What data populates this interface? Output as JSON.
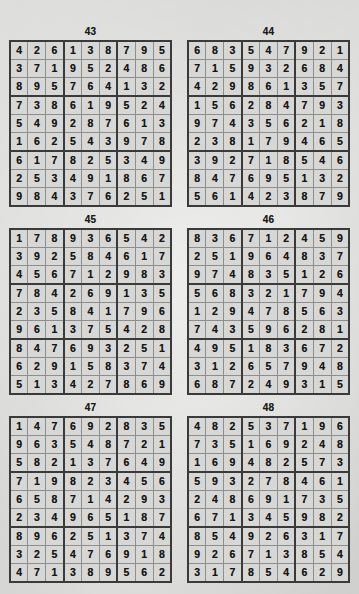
{
  "page": {
    "type": "sudoku-solutions-page",
    "background_color": "#d9d9d7",
    "ink_color": "#161616",
    "grid_line_color": "#8e8e8c",
    "box_line_color": "#3a3a3a",
    "columns": 2,
    "rows": 3
  },
  "puzzles": [
    {
      "number": "43",
      "grid": [
        [
          "4",
          "2",
          "6",
          "1",
          "3",
          "8",
          "7",
          "9",
          "5"
        ],
        [
          "3",
          "7",
          "1",
          "9",
          "5",
          "2",
          "4",
          "8",
          "6"
        ],
        [
          "8",
          "9",
          "5",
          "7",
          "6",
          "4",
          "1",
          "3",
          "2"
        ],
        [
          "7",
          "3",
          "8",
          "6",
          "1",
          "9",
          "5",
          "2",
          "4"
        ],
        [
          "5",
          "4",
          "9",
          "2",
          "8",
          "7",
          "6",
          "1",
          "3"
        ],
        [
          "1",
          "6",
          "2",
          "5",
          "4",
          "3",
          "9",
          "7",
          "8"
        ],
        [
          "6",
          "1",
          "7",
          "8",
          "2",
          "5",
          "3",
          "4",
          "9"
        ],
        [
          "2",
          "5",
          "3",
          "4",
          "9",
          "1",
          "8",
          "6",
          "7"
        ],
        [
          "9",
          "8",
          "4",
          "3",
          "7",
          "6",
          "2",
          "5",
          "1"
        ]
      ]
    },
    {
      "number": "44",
      "grid": [
        [
          "6",
          "8",
          "3",
          "5",
          "4",
          "7",
          "9",
          "2",
          "1"
        ],
        [
          "7",
          "1",
          "5",
          "9",
          "3",
          "2",
          "6",
          "8",
          "4"
        ],
        [
          "4",
          "2",
          "9",
          "8",
          "6",
          "1",
          "3",
          "5",
          "7"
        ],
        [
          "1",
          "5",
          "6",
          "2",
          "8",
          "4",
          "7",
          "9",
          "3"
        ],
        [
          "9",
          "7",
          "4",
          "3",
          "5",
          "6",
          "2",
          "1",
          "8"
        ],
        [
          "2",
          "3",
          "8",
          "1",
          "7",
          "9",
          "4",
          "6",
          "5"
        ],
        [
          "3",
          "9",
          "2",
          "7",
          "1",
          "8",
          "5",
          "4",
          "6"
        ],
        [
          "8",
          "4",
          "7",
          "6",
          "9",
          "5",
          "1",
          "3",
          "2"
        ],
        [
          "5",
          "6",
          "1",
          "4",
          "2",
          "3",
          "8",
          "7",
          "9"
        ]
      ]
    },
    {
      "number": "45",
      "grid": [
        [
          "1",
          "7",
          "8",
          "9",
          "3",
          "6",
          "5",
          "4",
          "2"
        ],
        [
          "3",
          "9",
          "2",
          "5",
          "8",
          "4",
          "6",
          "1",
          "7"
        ],
        [
          "4",
          "5",
          "6",
          "7",
          "1",
          "2",
          "9",
          "8",
          "3"
        ],
        [
          "7",
          "8",
          "4",
          "2",
          "6",
          "9",
          "1",
          "3",
          "5"
        ],
        [
          "2",
          "3",
          "5",
          "8",
          "4",
          "1",
          "7",
          "9",
          "6"
        ],
        [
          "9",
          "6",
          "1",
          "3",
          "7",
          "5",
          "4",
          "2",
          "8"
        ],
        [
          "8",
          "4",
          "7",
          "6",
          "9",
          "3",
          "2",
          "5",
          "1"
        ],
        [
          "6",
          "2",
          "9",
          "1",
          "5",
          "8",
          "3",
          "7",
          "4"
        ],
        [
          "5",
          "1",
          "3",
          "4",
          "2",
          "7",
          "8",
          "6",
          "9"
        ]
      ]
    },
    {
      "number": "46",
      "grid": [
        [
          "8",
          "3",
          "6",
          "7",
          "1",
          "2",
          "4",
          "5",
          "9"
        ],
        [
          "2",
          "5",
          "1",
          "9",
          "6",
          "4",
          "8",
          "3",
          "7"
        ],
        [
          "9",
          "7",
          "4",
          "8",
          "3",
          "5",
          "1",
          "2",
          "6"
        ],
        [
          "5",
          "6",
          "8",
          "3",
          "2",
          "1",
          "7",
          "9",
          "4"
        ],
        [
          "1",
          "2",
          "9",
          "4",
          "7",
          "8",
          "5",
          "6",
          "3"
        ],
        [
          "7",
          "4",
          "3",
          "5",
          "9",
          "6",
          "2",
          "8",
          "1"
        ],
        [
          "4",
          "9",
          "5",
          "1",
          "8",
          "3",
          "6",
          "7",
          "2"
        ],
        [
          "3",
          "1",
          "2",
          "6",
          "5",
          "7",
          "9",
          "4",
          "8"
        ],
        [
          "6",
          "8",
          "7",
          "2",
          "4",
          "9",
          "3",
          "1",
          "5"
        ]
      ]
    },
    {
      "number": "47",
      "grid": [
        [
          "1",
          "4",
          "7",
          "6",
          "9",
          "2",
          "8",
          "3",
          "5"
        ],
        [
          "9",
          "6",
          "3",
          "5",
          "4",
          "8",
          "7",
          "2",
          "1"
        ],
        [
          "5",
          "8",
          "2",
          "1",
          "3",
          "7",
          "6",
          "4",
          "9"
        ],
        [
          "7",
          "1",
          "9",
          "8",
          "2",
          "3",
          "4",
          "5",
          "6"
        ],
        [
          "6",
          "5",
          "8",
          "7",
          "1",
          "4",
          "2",
          "9",
          "3"
        ],
        [
          "2",
          "3",
          "4",
          "9",
          "6",
          "5",
          "1",
          "8",
          "7"
        ],
        [
          "8",
          "9",
          "6",
          "2",
          "5",
          "1",
          "3",
          "7",
          "4"
        ],
        [
          "3",
          "2",
          "5",
          "4",
          "7",
          "6",
          "9",
          "1",
          "8"
        ],
        [
          "4",
          "7",
          "1",
          "3",
          "8",
          "9",
          "5",
          "6",
          "2"
        ]
      ]
    },
    {
      "number": "48",
      "grid": [
        [
          "4",
          "8",
          "2",
          "5",
          "3",
          "7",
          "1",
          "9",
          "6"
        ],
        [
          "7",
          "3",
          "5",
          "1",
          "6",
          "9",
          "2",
          "4",
          "8"
        ],
        [
          "1",
          "6",
          "9",
          "4",
          "8",
          "2",
          "5",
          "7",
          "3"
        ],
        [
          "5",
          "9",
          "3",
          "2",
          "7",
          "8",
          "4",
          "6",
          "1"
        ],
        [
          "2",
          "4",
          "8",
          "6",
          "9",
          "1",
          "7",
          "3",
          "5"
        ],
        [
          "6",
          "7",
          "1",
          "3",
          "4",
          "5",
          "9",
          "8",
          "2"
        ],
        [
          "8",
          "5",
          "4",
          "9",
          "2",
          "6",
          "3",
          "1",
          "7"
        ],
        [
          "9",
          "2",
          "6",
          "7",
          "1",
          "3",
          "8",
          "5",
          "4"
        ],
        [
          "3",
          "1",
          "7",
          "8",
          "5",
          "4",
          "6",
          "2",
          "9"
        ]
      ]
    }
  ]
}
